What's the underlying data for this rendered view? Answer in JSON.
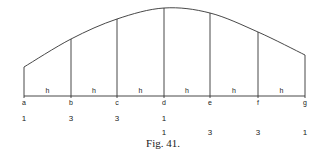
{
  "figure": {
    "caption": "Fig. 41.",
    "baseline_y": 96,
    "ordinates": [
      {
        "label": "a",
        "x": 24,
        "top": 67
      },
      {
        "label": "b",
        "x": 71,
        "top": 39
      },
      {
        "label": "c",
        "x": 117,
        "top": 19
      },
      {
        "label": "d",
        "x": 164,
        "top": 8
      },
      {
        "label": "e",
        "x": 210,
        "top": 13
      },
      {
        "label": "f",
        "x": 258,
        "top": 32
      },
      {
        "label": "g",
        "x": 305,
        "top": 55
      }
    ],
    "interval_label": "h",
    "intervals": [
      "h",
      "h",
      "h",
      "h",
      "h",
      "h"
    ],
    "weights_row1": [
      {
        "value": "1",
        "x": 24
      },
      {
        "value": "3",
        "x": 71
      },
      {
        "value": "3",
        "x": 117
      },
      {
        "value": "1",
        "x": 164
      }
    ],
    "weights_row2": [
      {
        "value": "1",
        "x": 164
      },
      {
        "value": "3",
        "x": 210
      },
      {
        "value": "3",
        "x": 258
      },
      {
        "value": "1",
        "x": 305
      }
    ]
  }
}
